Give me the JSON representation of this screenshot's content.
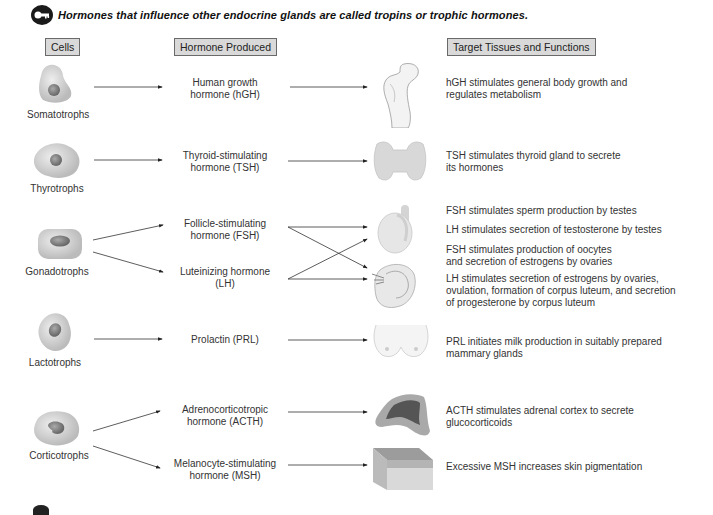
{
  "title": "Hormones that influence other endocrine glands are called tropins or trophic hormones.",
  "title_icon": "key-icon",
  "headers": {
    "cells": "Cells",
    "hormone": "Hormone Produced",
    "target": "Target Tissues and Functions"
  },
  "rows": [
    {
      "cell": "Somatotrophs",
      "hormones": [
        {
          "line1": "Human growth",
          "line2": "hormone (hGH)"
        }
      ],
      "target_icon": "bone-icon",
      "functions": [
        {
          "line1": "hGH stimulates general body growth and",
          "line2": "regulates metabolism"
        }
      ]
    },
    {
      "cell": "Thyrotrophs",
      "hormones": [
        {
          "line1": "Thyroid-stimulating",
          "line2": "hormone (TSH)"
        }
      ],
      "target_icon": "thyroid-icon",
      "functions": [
        {
          "line1": "TSH stimulates thyroid gland to secrete",
          "line2": "its hormones"
        }
      ]
    },
    {
      "cell": "Gonadotrophs",
      "hormones": [
        {
          "line1": "Follicle-stimulating",
          "line2": "hormone (FSH)"
        },
        {
          "line1": "Luteinizing hormone",
          "line2": "(LH)"
        }
      ],
      "target_icons": [
        "testis-icon",
        "ovary-icon"
      ],
      "functions": [
        {
          "line1": "FSH stimulates sperm production by testes"
        },
        {
          "line1": "LH stimulates secretion of testosterone by testes"
        },
        {
          "line1": "FSH stimulates production of oocytes",
          "line2": "and secretion of estrogens by ovaries"
        },
        {
          "line1": "LH stimulates secretion of estrogens by ovaries,",
          "line2": "ovulation, formation of corpus luteum, and secretion",
          "line3": "of progesterone by corpus luteum"
        }
      ]
    },
    {
      "cell": "Lactotrophs",
      "hormones": [
        {
          "line1": "Prolactin (PRL)"
        }
      ],
      "target_icon": "mammary-icon",
      "functions": [
        {
          "line1": "PRL initiates milk production in suitably prepared",
          "line2": "mammary glands"
        }
      ]
    },
    {
      "cell": "Corticotrophs",
      "hormones": [
        {
          "line1": "Adrenocorticotropic",
          "line2": "hormone (ACTH)"
        },
        {
          "line1": "Melanocyte-stimulating",
          "line2": "hormone (MSH)"
        }
      ],
      "target_icons": [
        "adrenal-icon",
        "skin-icon"
      ],
      "functions": [
        {
          "line1": "ACTH stimulates adrenal cortex to secrete",
          "line2": "glucocorticoids"
        },
        {
          "line1": "Excessive MSH  increases skin pigmentation"
        }
      ]
    }
  ],
  "colors": {
    "header_bg": "#d9d9d9",
    "header_border": "#6a6a6a",
    "cell_body": "#c8c8c8",
    "cell_nucleus": "#8a8a8a",
    "arrow": "#222222"
  }
}
